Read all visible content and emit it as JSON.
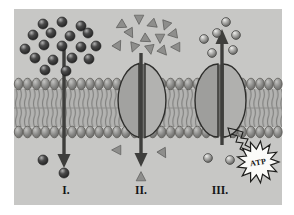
{
  "labels": {
    "section1": "I.",
    "section2": "II.",
    "section3": "III.",
    "atp": "ATP"
  },
  "colors": {
    "panel_bg": "#c7c7c5",
    "page_bg": "#ffffff",
    "membrane_head": "#8a8a88",
    "membrane_tails_bg": "#b3b3b1",
    "membrane_tail_line": "#7a7a78",
    "protein_left_lobe": "#9e9e9c",
    "protein_right_lobe": "#b2b2b0",
    "protein_channel": "#6e6e6c",
    "dark_particle": "#3c3c3c",
    "light_particle": "#9a9a98",
    "triangle_particle": "#8e8e8c",
    "arrow": "#3e3e3c",
    "atp_burst_fill": "#fbfbf9",
    "outline": "#2e2e2c"
  },
  "particles": {
    "dark_spheres_above": [
      [
        43,
        24
      ],
      [
        62,
        22
      ],
      [
        81,
        26
      ],
      [
        33,
        35
      ],
      [
        51,
        33
      ],
      [
        70,
        36
      ],
      [
        88,
        33
      ],
      [
        25,
        49
      ],
      [
        44,
        45
      ],
      [
        62,
        46
      ],
      [
        81,
        47
      ],
      [
        96,
        46
      ],
      [
        35,
        58
      ],
      [
        53,
        60
      ],
      [
        72,
        58
      ],
      [
        89,
        59
      ],
      [
        45,
        70
      ],
      [
        66,
        71
      ]
    ],
    "dark_spheres_below": [
      [
        43,
        160
      ],
      [
        64,
        173
      ]
    ],
    "triangles_above": [
      [
        121,
        25,
        240
      ],
      [
        139,
        19,
        180
      ],
      [
        152,
        24,
        250
      ],
      [
        166,
        25,
        200
      ],
      [
        130,
        33,
        150
      ],
      [
        146,
        39,
        120
      ],
      [
        160,
        38,
        180
      ],
      [
        173,
        34,
        260
      ],
      [
        118,
        45,
        30
      ],
      [
        134,
        47,
        200
      ],
      [
        150,
        49,
        170
      ],
      [
        163,
        51,
        140
      ],
      [
        176,
        47,
        270
      ]
    ],
    "triangles_below": [
      [
        117,
        150,
        270
      ],
      [
        163,
        153,
        150
      ],
      [
        141,
        177,
        0
      ]
    ],
    "light_spheres_above": [
      [
        226,
        22
      ],
      [
        204,
        39
      ],
      [
        217,
        33
      ],
      [
        236,
        35
      ],
      [
        212,
        53
      ],
      [
        233,
        50
      ]
    ],
    "light_spheres_below": [
      [
        208,
        158
      ],
      [
        230,
        160
      ]
    ]
  },
  "arrows": [
    {
      "name": "diffusion-arrow",
      "x": 64,
      "from": 46,
      "to": 168,
      "dir": "down"
    },
    {
      "name": "facilitated-diffusion-arrow",
      "x": 141,
      "from": 53,
      "to": 167,
      "dir": "down"
    },
    {
      "name": "active-transport-arrow",
      "x": 222,
      "from": 145,
      "to": 29,
      "dir": "up"
    }
  ],
  "atp_burst": {
    "cx": 258,
    "cy": 162,
    "outer_r": 21,
    "inner_r": 13,
    "spikes": 13
  }
}
